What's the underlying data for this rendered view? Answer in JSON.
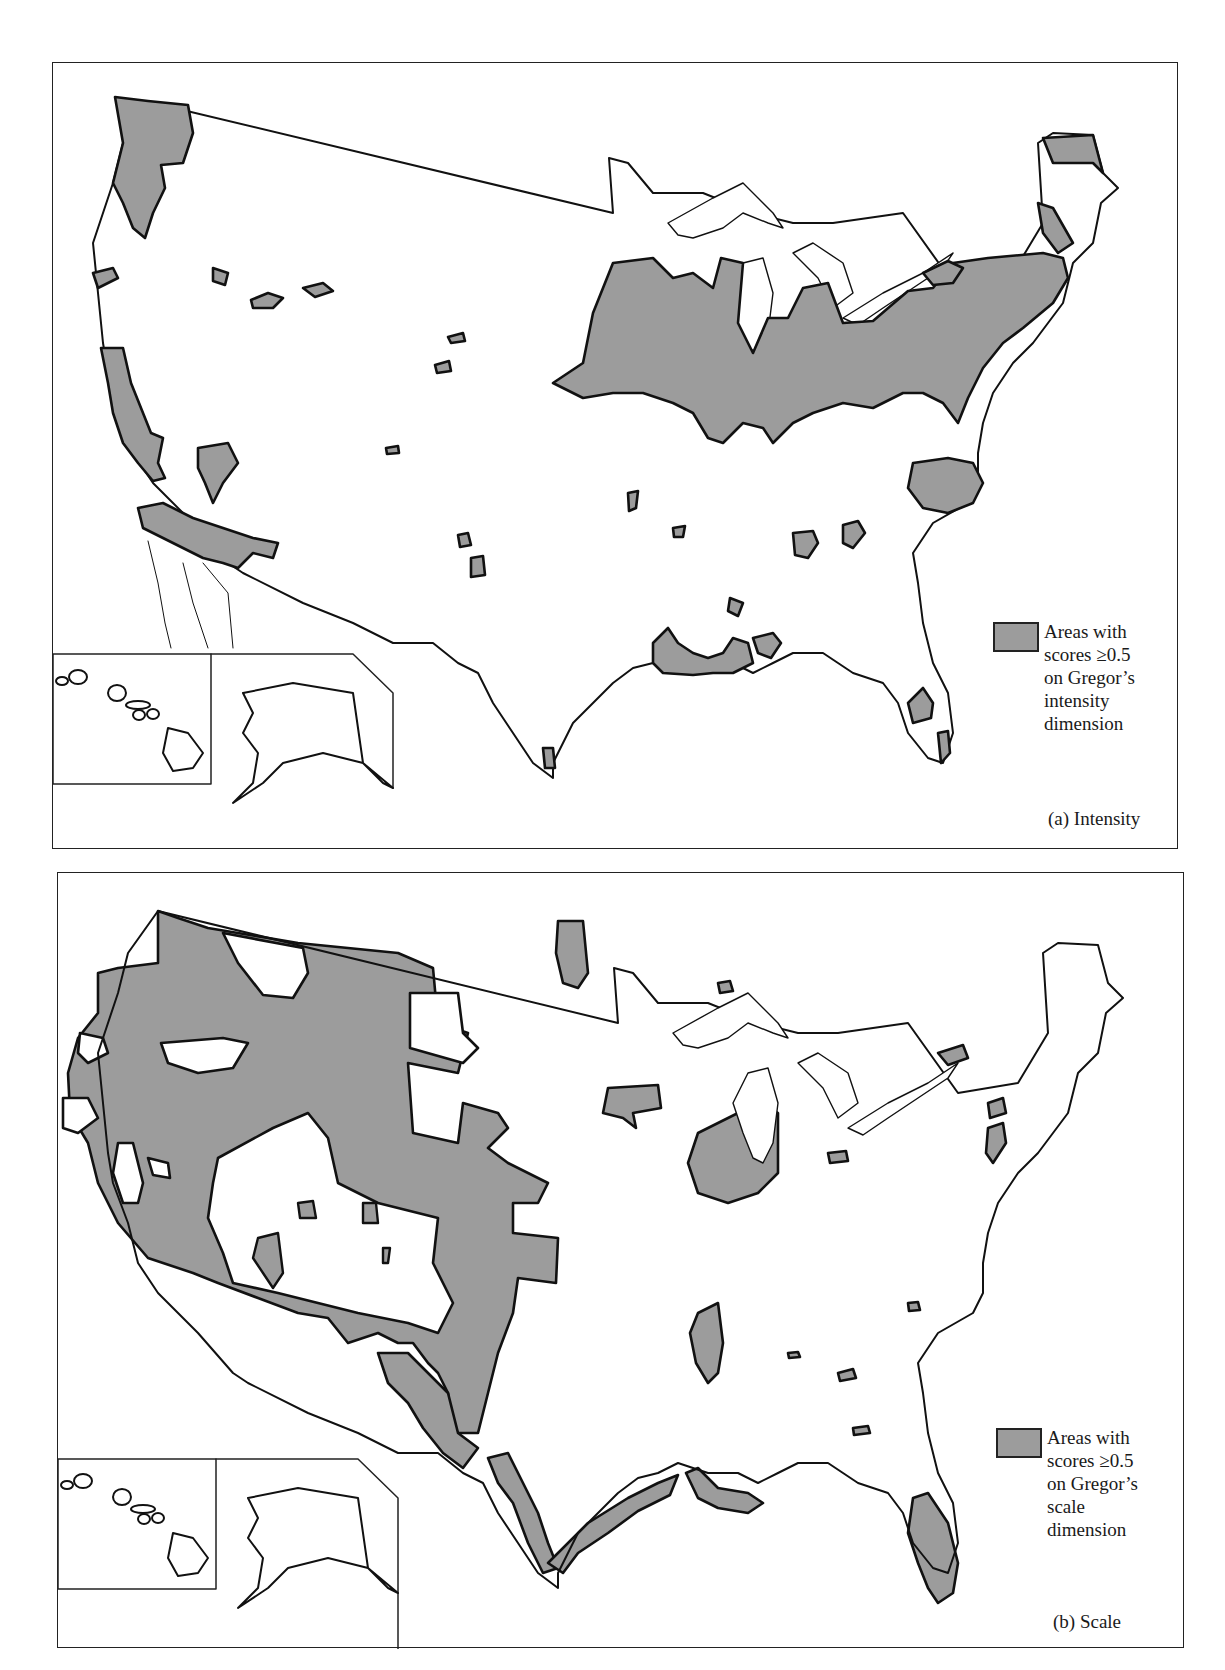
{
  "colors": {
    "fill": "#9c9c9c",
    "outline": "#111111",
    "frame": "#222222",
    "background": "#ffffff"
  },
  "panels": [
    {
      "id": "a",
      "caption": "(a) Intensity",
      "legend": {
        "swatch": "gray-filled-rectangle",
        "lines": [
          "Areas with",
          "scores ≥0.5",
          "on Gregor’s",
          "intensity",
          "dimension"
        ]
      },
      "highlighted_regions": [
        "Pacific Northwest (Puget Sound / western Washington)",
        "Central & southern California coast",
        "Southern California / Arizona border strip",
        "Manufacturing belt: Midwest to Northeast (Iowa/Illinois through New England)",
        "Northern Maine / New Brunswick border",
        "North Carolina piedmont",
        "Gulf Coast (Louisiana / Mississippi / Alabama)",
        "Central Florida",
        "Scattered small islands in the Plains, Rockies and South"
      ],
      "insets": [
        "Hawaii",
        "Alaska"
      ]
    },
    {
      "id": "b",
      "caption": "(b) Scale",
      "legend": {
        "swatch": "gray-filled-rectangle",
        "lines": [
          "Areas with",
          "scores ≥0.5",
          "on Gregor’s",
          "scale",
          "dimension"
        ]
      },
      "highlighted_regions": [
        "Most of the western United States (Pacific coast to Great Plains)",
        "Southern Plains strip through Texas panhandle",
        "Minnesota / North Dakota border strip",
        "Western Lake Superior",
        "Iowa",
        "Illinois / Indiana",
        "Mississippi Delta",
        "Texas Gulf Coast",
        "Louisiana coast",
        "Florida peninsula",
        "Northeast coastal pockets (Long Island, Delmarva)",
        "Ontario shore of Lake Ontario"
      ],
      "insets": [
        "Hawaii",
        "Alaska"
      ]
    }
  ]
}
